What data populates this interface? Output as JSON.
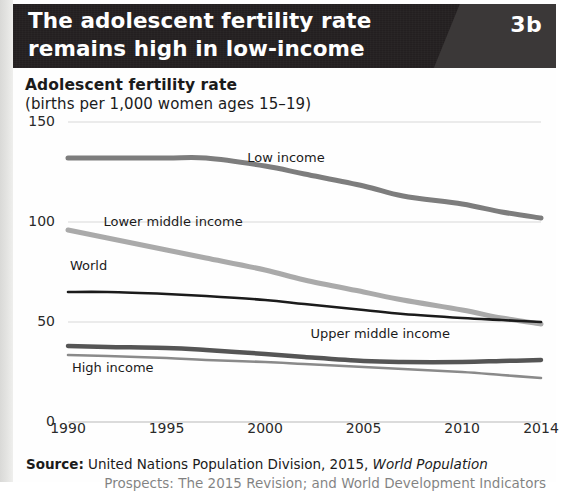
{
  "header": {
    "title_line1": "The adolescent fertility rate",
    "title_line2": "remains high in low-income countries",
    "badge": "3b",
    "background_color": "#231f20",
    "badge_panel_color": "#3b3838"
  },
  "chart_data": {
    "type": "line",
    "title": "Adolescent fertility rate",
    "subtitle": "(births per 1,000 women ages 15–19)",
    "xlabel": "",
    "ylabel": "",
    "xlim": [
      1990,
      2014
    ],
    "ylim": [
      0,
      150
    ],
    "yticks": [
      0,
      50,
      100,
      150
    ],
    "ytick_labels": [
      "0",
      "50",
      "100",
      "150"
    ],
    "xticks": [
      1990,
      1995,
      2000,
      2005,
      2010,
      2014
    ],
    "xtick_labels": [
      "1990",
      "1995",
      "2000",
      "2005",
      "2010",
      "2014"
    ],
    "grid": true,
    "legend": "inline-labels",
    "x": [
      1990,
      1992,
      1995,
      1997,
      2000,
      2002,
      2005,
      2007,
      2010,
      2012,
      2014
    ],
    "series": [
      {
        "name": "Low income",
        "color": "#7d7d7d",
        "width": 5,
        "label_x": 1999.1,
        "label_y": 132,
        "values": [
          132,
          132,
          132,
          132,
          128,
          124,
          118,
          113,
          109,
          105,
          102
        ]
      },
      {
        "name": "Lower middle income",
        "color": "#aaaaaa",
        "width": 5,
        "label_x": 1991.8,
        "label_y": 100,
        "values": [
          96,
          92,
          86,
          82,
          76,
          71,
          65,
          61,
          56,
          52,
          49
        ]
      },
      {
        "name": "World",
        "color": "#1b1b1b",
        "width": 2.6,
        "label_x": 1990.1,
        "label_y": 78,
        "values": [
          65,
          65,
          64,
          63,
          61,
          59,
          56,
          54,
          52,
          51,
          50
        ]
      },
      {
        "name": "Upper middle income",
        "color": "#555555",
        "width": 4.5,
        "label_x": 2002.3,
        "label_y": 44,
        "values": [
          38,
          37.5,
          37,
          36,
          34,
          32.5,
          30.5,
          30,
          30,
          30.5,
          31
        ]
      },
      {
        "name": "High income",
        "color": "#8a8a8a",
        "width": 2.6,
        "label_x": 1990.2,
        "label_y": 27,
        "values": [
          33.5,
          33,
          32,
          31,
          30,
          29,
          27.5,
          26.5,
          25,
          23.5,
          22
        ]
      }
    ]
  },
  "source": {
    "label": "Source:",
    "text": " United Nations Population Division, 2015, ",
    "italic": "World Population",
    "line2": "Prospects: The 2015 Revision; and World Development Indicators"
  }
}
